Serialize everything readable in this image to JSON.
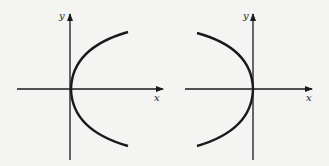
{
  "figure": {
    "background": "#f4f4f2",
    "ink": "#1a1a1a",
    "panels": [
      {
        "name": "parabola-opening-right",
        "x_label": "x",
        "y_label": "y",
        "direction": "right"
      },
      {
        "name": "parabola-opening-left",
        "x_label": "x",
        "y_label": "y",
        "direction": "left"
      }
    ]
  }
}
